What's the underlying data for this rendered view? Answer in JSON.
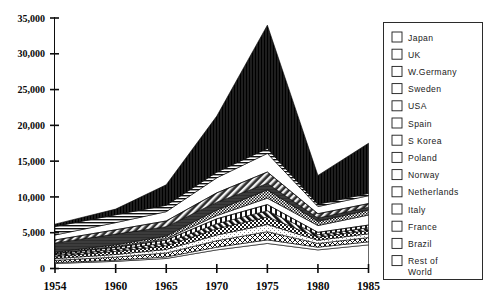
{
  "chart_data": {
    "type": "area",
    "stacked": true,
    "title": "",
    "subtitle": "",
    "xlabel": "",
    "ylabel": "",
    "x": [
      1954,
      1960,
      1965,
      1970,
      1975,
      1980,
      1985
    ],
    "xtick_labels": [
      "1954",
      "1960",
      "1965",
      "1970",
      "1975",
      "1980",
      "1985"
    ],
    "ytick_labels": [
      "0",
      "5,000",
      "10,000",
      "15,000",
      "20,000",
      "25,000",
      "30,000",
      "35,000"
    ],
    "ytick_values": [
      0,
      5000,
      10000,
      15000,
      20000,
      25000,
      30000,
      35000
    ],
    "ylim": [
      0,
      35000
    ],
    "xlim": [
      1954,
      1985
    ],
    "grid": false,
    "legend_position": "right",
    "totals": [
      5200,
      8300,
      11700,
      21300,
      34000,
      13000,
      17500
    ],
    "series": [
      {
        "name": "Rest of World",
        "pattern": "solid-mid-gray",
        "color": "#6e6e6e",
        "values": [
          700,
          1000,
          1400,
          2600,
          3500,
          2600,
          3300
        ]
      },
      {
        "name": "Brazil",
        "pattern": "white-empty",
        "color": "#ffffff",
        "values": [
          120,
          170,
          220,
          380,
          500,
          380,
          430
        ]
      },
      {
        "name": "France",
        "pattern": "crosshatch-x",
        "color": "#b5b5b5",
        "values": [
          320,
          430,
          560,
          900,
          1150,
          520,
          600
        ]
      },
      {
        "name": "Italy",
        "pattern": "light-gray",
        "color": "#c9c9c9",
        "values": [
          250,
          360,
          480,
          800,
          1000,
          450,
          520
        ]
      },
      {
        "name": "Netherlands",
        "pattern": "checker",
        "color": "#9a9a9a",
        "values": [
          300,
          420,
          520,
          880,
          1050,
          430,
          470
        ]
      },
      {
        "name": "Norway",
        "pattern": "diagonal-bold-down",
        "color": "#4a4a4a",
        "values": [
          210,
          300,
          400,
          700,
          880,
          340,
          380
        ]
      },
      {
        "name": "Poland",
        "pattern": "vertical-stripes",
        "color": "#8a8a8a",
        "values": [
          180,
          280,
          390,
          680,
          850,
          330,
          370
        ]
      },
      {
        "name": "S Korea",
        "pattern": "diagonal-sparse-down",
        "color": "#a0a0a0",
        "values": [
          60,
          110,
          190,
          450,
          900,
          950,
          1400
        ]
      },
      {
        "name": "Spain",
        "pattern": "fine-dots",
        "color": "#8f8f8f",
        "values": [
          140,
          240,
          380,
          780,
          1150,
          600,
          700
        ]
      },
      {
        "name": "USA",
        "pattern": "solid-dark",
        "color": "#3a3a3a",
        "values": [
          1300,
          1500,
          1300,
          1100,
          900,
          450,
          400
        ]
      },
      {
        "name": "Sweden",
        "pattern": "diagonal-solid-up",
        "color": "#555555",
        "values": [
          400,
          600,
          800,
          1300,
          1600,
          600,
          500
        ]
      },
      {
        "name": "W.Germany",
        "pattern": "vertical-bars",
        "color": "#9d9d9d",
        "values": [
          700,
          1000,
          1300,
          2100,
          2600,
          1000,
          1100
        ]
      },
      {
        "name": "UK",
        "pattern": "horizontal-lines",
        "color": "#7d7d7d",
        "values": [
          1200,
          1100,
          900,
          800,
          700,
          330,
          330
        ]
      },
      {
        "name": "Japan",
        "pattern": "vertical-dense",
        "color": "#2a2a2a",
        "values": [
          320,
          790,
          2860,
          7830,
          17220,
          4020,
          7000
        ]
      }
    ]
  },
  "legend": {
    "items": [
      {
        "label": "Japan"
      },
      {
        "label": "UK"
      },
      {
        "label": "W.Germany"
      },
      {
        "label": "Sweden"
      },
      {
        "label": "USA"
      },
      {
        "label": "Spain"
      },
      {
        "label": "S Korea"
      },
      {
        "label": "Poland"
      },
      {
        "label": "Norway"
      },
      {
        "label": "Netherlands"
      },
      {
        "label": "Italy"
      },
      {
        "label": "France"
      },
      {
        "label": "Brazil"
      },
      {
        "label": "Rest of"
      },
      {
        "label": "World"
      }
    ]
  }
}
